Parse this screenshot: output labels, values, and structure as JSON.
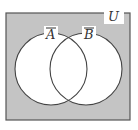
{
  "diagram": {
    "type": "venn",
    "universe_label": "U",
    "sets": [
      {
        "label": "A",
        "complement": true
      },
      {
        "label": "B",
        "complement": true
      }
    ],
    "shaded_region": "complement of (A union B)",
    "colors": {
      "shade": "#c4c4c4",
      "outline": "#444444",
      "circle_fill": "#ffffff",
      "background": "#ffffff"
    }
  }
}
